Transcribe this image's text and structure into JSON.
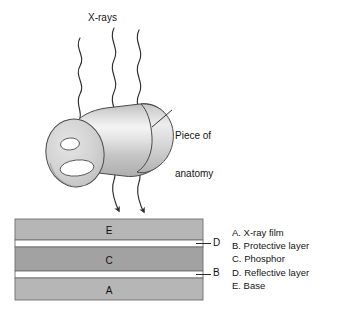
{
  "figure": {
    "title_labels": {
      "xrays": "X-rays",
      "anatomy_line1": "Piece of",
      "anatomy_line2": "anatomy"
    },
    "stack": {
      "layers": [
        {
          "letter": "E",
          "name": "base-layer"
        },
        {
          "letter": "D",
          "name": "reflective-layer"
        },
        {
          "letter": "C",
          "name": "phosphor-layer"
        },
        {
          "letter": "B",
          "name": "protective-layer"
        },
        {
          "letter": "A",
          "name": "xray-film-layer"
        }
      ],
      "callouts": [
        {
          "letter": "D"
        },
        {
          "letter": "B"
        }
      ]
    },
    "legend": {
      "items": [
        {
          "key": "A",
          "text": "A. X-ray film"
        },
        {
          "key": "B",
          "text": "B. Protective layer"
        },
        {
          "key": "C",
          "text": "C. Phosphor"
        },
        {
          "key": "D",
          "text": "D. Reflective layer"
        },
        {
          "key": "E",
          "text": "E. Base"
        }
      ]
    },
    "colors": {
      "background": "#ffffff",
      "outline": "#3a3a3a",
      "ray_stroke": "#2e2e2e",
      "layer_light": "#b9b9b9",
      "layer_dark": "#9a9a9a",
      "gap_white": "#ffffff",
      "cylinder_face": "#d2d2d2",
      "cylinder_body_light": "#f2f2f2",
      "cylinder_body_mid": "#c9c9c9",
      "text": "#141414"
    },
    "icons": {
      "ray": "wavy-ray-icon",
      "arrowhead": "arrowhead-icon",
      "cylinder": "cylinder-icon",
      "leader": "leader-line-icon"
    }
  }
}
